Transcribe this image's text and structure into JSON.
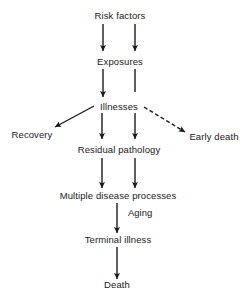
{
  "diagram": {
    "nodes": [
      {
        "id": "risk_factors",
        "label": "Risk factors"
      },
      {
        "id": "exposures",
        "label": "Exposures"
      },
      {
        "id": "illnesses",
        "label": "Illnesses"
      },
      {
        "id": "recovery",
        "label": "Recovery"
      },
      {
        "id": "early_death",
        "label": "Early death"
      },
      {
        "id": "residual_pathology",
        "label": "Residual pathology"
      },
      {
        "id": "multiple_disease_processes",
        "label": "Multiple disease processes"
      },
      {
        "id": "terminal_illness",
        "label": "Terminal illness"
      },
      {
        "id": "death",
        "label": "Death"
      }
    ],
    "edges": [
      {
        "from": "risk_factors",
        "to": "exposures",
        "style": "solid",
        "arrowhead": true
      },
      {
        "from": "risk_factors",
        "to": "exposures",
        "style": "solid",
        "arrowhead": true
      },
      {
        "from": "exposures",
        "to": "illnesses",
        "style": "solid",
        "arrowhead": true
      },
      {
        "from": "exposures",
        "to": "illnesses",
        "style": "solid",
        "arrowhead": false
      },
      {
        "from": "illnesses",
        "to": "recovery",
        "style": "solid",
        "arrowhead": true
      },
      {
        "from": "illnesses",
        "to": "residual_pathology",
        "style": "solid",
        "arrowhead": true
      },
      {
        "from": "illnesses",
        "to": "residual_pathology",
        "style": "solid",
        "arrowhead": true
      },
      {
        "from": "illnesses",
        "to": "early_death",
        "style": "dashed",
        "arrowhead": true
      },
      {
        "from": "residual_pathology",
        "to": "multiple_disease_processes",
        "style": "solid",
        "arrowhead": true
      },
      {
        "from": "residual_pathology",
        "to": "multiple_disease_processes",
        "style": "solid",
        "arrowhead": true
      },
      {
        "from": "multiple_disease_processes",
        "to": "terminal_illness",
        "style": "solid",
        "arrowhead": true,
        "label": "Aging"
      },
      {
        "from": "terminal_illness",
        "to": "death",
        "style": "solid",
        "arrowhead": true
      }
    ],
    "edge_labels": {
      "aging": "Aging"
    },
    "colors": {
      "ink": "#1a1a1a",
      "background": "#ffffff"
    }
  }
}
